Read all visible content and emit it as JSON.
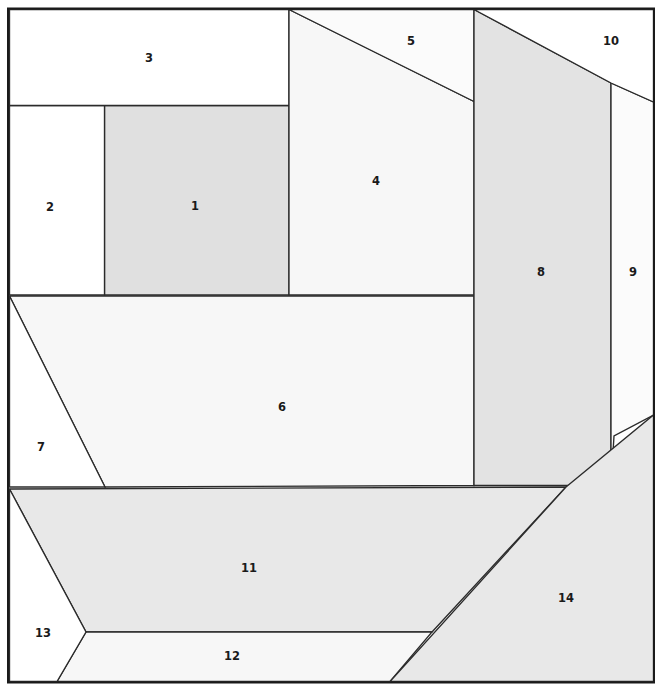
{
  "figure": {
    "title": "",
    "canvas": {
      "width": 662,
      "height": 691,
      "background": "#ffffff"
    },
    "frame": {
      "x": 8.0,
      "y": 8.5,
      "width": 646.0,
      "height": 674.0,
      "stroke": "#1a1a1a",
      "stroke_width": 2
    },
    "style": {
      "edge_color": "#2b2b2b",
      "edge_width": 1.35,
      "label_color": "#1a1a1a",
      "label_font_size": 11.5,
      "label_font_weight": "bold"
    },
    "palette": {
      "white": "#ffffff",
      "very_light": "#fafafa",
      "light": "#f4f4f4",
      "medium_light": "#ededed",
      "medium": "#e8e8e8",
      "dark": "#e0e0e0"
    },
    "regions": [
      {
        "id": 1,
        "label": "1",
        "fill": "#e0e0e0",
        "label_pos": [
          195,
          206
        ],
        "points": "104.5,105.5 289,105.5 289,295 104.5,295"
      },
      {
        "id": 2,
        "label": "2",
        "fill": "#ffffff",
        "label_pos": [
          50,
          207
        ],
        "points": "9.5,105.5 104.5,105.5 104.5,295 9.5,295"
      },
      {
        "id": 3,
        "label": "3",
        "fill": "#ffffff",
        "label_pos": [
          149,
          58
        ],
        "points": "9.5,9.5 289,9.5 289,105.5 9.5,105.5"
      },
      {
        "id": 4,
        "label": "4",
        "fill": "#f7f7f7",
        "label_pos": [
          376,
          181
        ],
        "points": "289,9.5 474,101.5 474,295 289,295"
      },
      {
        "id": 5,
        "label": "5",
        "fill": "#fbfbfb",
        "label_pos": [
          411,
          41
        ],
        "points": "289,9.5 474,9.5 474,101.5"
      },
      {
        "id": 6,
        "label": "6",
        "fill": "#f7f7f7",
        "label_pos": [
          282,
          407
        ],
        "points": "9.5,296 474,296 474,485.5 105,487"
      },
      {
        "id": 7,
        "label": "7",
        "fill": "#ffffff",
        "label_pos": [
          41,
          447
        ],
        "points": "9.5,296 105,487 9.5,487"
      },
      {
        "id": 8,
        "label": "8",
        "fill": "#e3e3e3",
        "label_pos": [
          541,
          272
        ],
        "points": "474,9.5 611,83 611,485.5 474,485.5"
      },
      {
        "id": 9,
        "label": "9",
        "fill": "#fbfbfb",
        "label_pos": [
          633,
          272
        ],
        "points": "611,83 653.5,102 653.5,415 614,436 611,485.5"
      },
      {
        "id": 10,
        "label": "10",
        "fill": "#ffffff",
        "label_pos": [
          611,
          41
        ],
        "points": "474,9.5 653.5,9.5 653.5,102 611,83"
      },
      {
        "id": 11,
        "label": "11",
        "fill": "#e8e8e8",
        "label_pos": [
          249,
          568
        ],
        "points": "9.5,489 566,487 432,632 86,632"
      },
      {
        "id": 12,
        "label": "12",
        "fill": "#f7f7f7",
        "label_pos": [
          232,
          656
        ],
        "points": "86,632 432,632 390,681.5 57,681.5"
      },
      {
        "id": 13,
        "label": "13",
        "fill": "#ffffff",
        "label_pos": [
          43,
          633
        ],
        "points": "9.5,489 86,632 57,681.5 9.5,681.5"
      },
      {
        "id": 14,
        "label": "14",
        "fill": "#e8e8e8",
        "label_pos": [
          566,
          598
        ],
        "points": "566,487 653.5,415 653.5,681.5 390,681.5"
      }
    ]
  }
}
